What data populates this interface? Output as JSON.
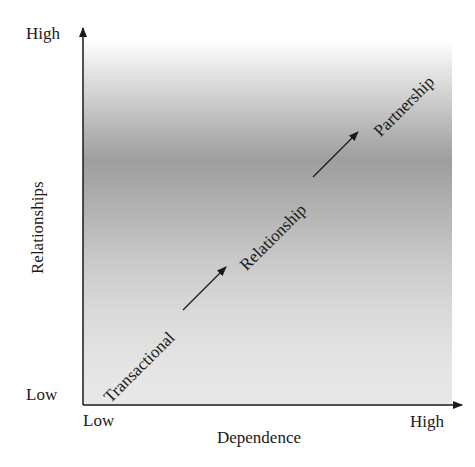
{
  "diagram": {
    "y_axis": {
      "title": "Relationships",
      "high_label": "High",
      "low_label": "Low"
    },
    "x_axis": {
      "title": "Dependence",
      "low_label": "Low",
      "high_label": "High"
    },
    "stages": [
      {
        "label": "Transactional"
      },
      {
        "label": "Relationship"
      },
      {
        "label": "Partnership"
      }
    ],
    "colors": {
      "axis": "#1a1a1a",
      "gradient_dark": "#9e9e9e",
      "gradient_light": "#e8e8e8"
    }
  }
}
